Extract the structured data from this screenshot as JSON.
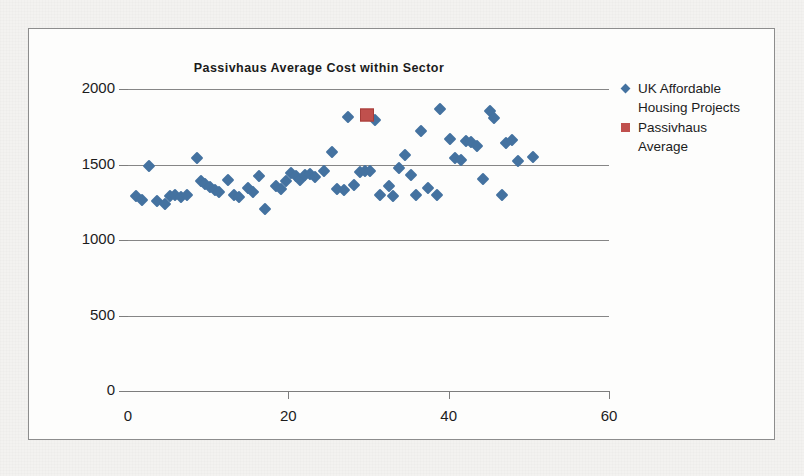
{
  "chart_data": {
    "type": "scatter",
    "title": "Passivhaus Average Cost within Sector",
    "xlabel": "",
    "ylabel": "",
    "xlim": [
      0,
      60
    ],
    "ylim": [
      0,
      2000
    ],
    "xticks": [
      "0",
      "20",
      "40",
      "60"
    ],
    "xtick_values": [
      0,
      20,
      40,
      60
    ],
    "yticks": [
      "0",
      "500",
      "1000",
      "1500",
      "2000"
    ],
    "ytick_values": [
      0,
      500,
      1000,
      1500,
      2000
    ],
    "grid": "horizontal",
    "legend_position": "right",
    "colors": {
      "series_1": "#4472A0",
      "series_2": "#C0504D",
      "gridline": "#868686",
      "axis": "#7D7D7D",
      "text": "#1C1C1C",
      "plot_background": "#FDFDFC",
      "page_background": "#F3F2F0",
      "frame_border": "#8D8D8D"
    },
    "series": [
      {
        "name": "UK Affordable Housing Projects",
        "marker": "diamond",
        "color": "#4472A0",
        "points": [
          [
            1.0,
            1290
          ],
          [
            1.8,
            1268
          ],
          [
            2.6,
            1488
          ],
          [
            3.6,
            1258
          ],
          [
            4.6,
            1238
          ],
          [
            5.2,
            1290
          ],
          [
            5.9,
            1300
          ],
          [
            6.6,
            1282
          ],
          [
            7.3,
            1300
          ],
          [
            8.6,
            1545
          ],
          [
            9.1,
            1392
          ],
          [
            9.6,
            1368
          ],
          [
            10.2,
            1350
          ],
          [
            10.8,
            1330
          ],
          [
            11.4,
            1315
          ],
          [
            12.5,
            1398
          ],
          [
            13.2,
            1300
          ],
          [
            13.8,
            1285
          ],
          [
            15.0,
            1345
          ],
          [
            15.6,
            1320
          ],
          [
            16.3,
            1425
          ],
          [
            17.1,
            1205
          ],
          [
            18.4,
            1360
          ],
          [
            19.1,
            1335
          ],
          [
            19.7,
            1390
          ],
          [
            20.3,
            1442
          ],
          [
            20.9,
            1425
          ],
          [
            21.4,
            1395
          ],
          [
            22.1,
            1432
          ],
          [
            22.7,
            1440
          ],
          [
            23.3,
            1415
          ],
          [
            24.4,
            1455
          ],
          [
            25.5,
            1585
          ],
          [
            26.1,
            1340
          ],
          [
            26.9,
            1330
          ],
          [
            27.4,
            1812
          ],
          [
            28.2,
            1365
          ],
          [
            29.0,
            1448
          ],
          [
            29.6,
            1460
          ],
          [
            30.2,
            1455
          ],
          [
            30.8,
            1795
          ],
          [
            31.4,
            1295
          ],
          [
            32.5,
            1360
          ],
          [
            33.1,
            1292
          ],
          [
            33.8,
            1475
          ],
          [
            34.5,
            1565
          ],
          [
            35.3,
            1430
          ],
          [
            35.9,
            1300
          ],
          [
            36.6,
            1722
          ],
          [
            37.4,
            1345
          ],
          [
            38.6,
            1298
          ],
          [
            38.9,
            1870
          ],
          [
            40.2,
            1672
          ],
          [
            40.8,
            1540
          ],
          [
            41.5,
            1528
          ],
          [
            42.2,
            1655
          ],
          [
            42.8,
            1648
          ],
          [
            43.5,
            1625
          ],
          [
            44.3,
            1405
          ],
          [
            45.1,
            1855
          ],
          [
            45.6,
            1805
          ],
          [
            46.6,
            1298
          ],
          [
            47.2,
            1645
          ],
          [
            47.9,
            1660
          ],
          [
            48.6,
            1520
          ],
          [
            50.5,
            1548
          ]
        ]
      },
      {
        "name": "Passivhaus Average",
        "marker": "square",
        "color": "#C0504D",
        "points": [
          [
            29.8,
            1828
          ]
        ]
      }
    ]
  },
  "legend": {
    "entries": [
      {
        "label_line_1": "UK Affordable",
        "label_line_2": "Housing Projects",
        "marker": "diamond-marker"
      },
      {
        "label_line_1": "Passivhaus",
        "label_line_2": "Average",
        "marker": "square-marker"
      }
    ]
  }
}
